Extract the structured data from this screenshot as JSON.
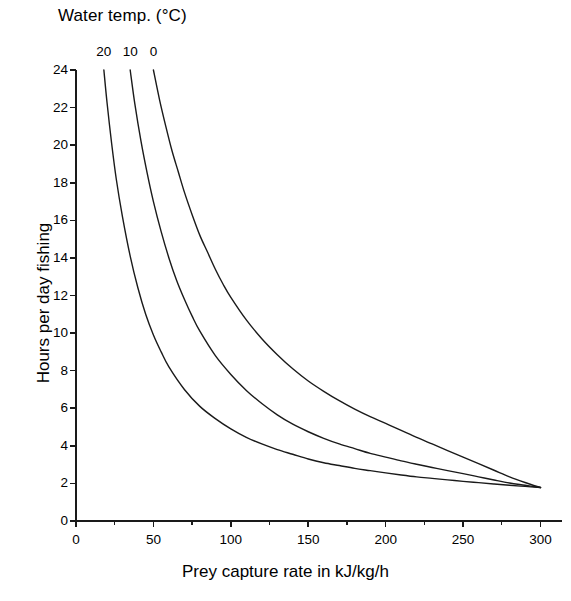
{
  "chart_data": {
    "type": "line",
    "title": "",
    "legend_title": "Water temp. (°C)",
    "legend_position": "top-inside-curve-labels",
    "grid": false,
    "xlabel": "Prey capture rate in kJ/kg/h",
    "ylabel": "Hours per day fishing",
    "xlim": [
      0,
      310
    ],
    "ylim": [
      0,
      24
    ],
    "xticks": [
      0,
      50,
      100,
      150,
      200,
      250,
      300
    ],
    "xtick_labels": [
      "0",
      "50",
      "100",
      "150",
      "200",
      "250",
      "300"
    ],
    "xminor_ticks": [
      25,
      75,
      125,
      175,
      225,
      275
    ],
    "yticks": [
      0,
      2,
      4,
      6,
      8,
      10,
      12,
      14,
      16,
      18,
      20,
      22,
      24
    ],
    "ytick_labels": [
      "0",
      "2",
      "4",
      "6",
      "8",
      "10",
      "12",
      "14",
      "16",
      "18",
      "20",
      "22",
      "24"
    ],
    "line_color": "#1a1a1a",
    "line_width": 1.4,
    "axis_color": "#1a1a1a",
    "background": "#ffffff",
    "series": [
      {
        "name": "20",
        "label": "20",
        "label_x": 18,
        "label_y": 24,
        "x": [
          18,
          20,
          23,
          26,
          30,
          35,
          40,
          45,
          50,
          55,
          60,
          70,
          80,
          90,
          100,
          110,
          120,
          130,
          140,
          150,
          160,
          170,
          180,
          190,
          200,
          210,
          220,
          230,
          240,
          250,
          260,
          270,
          280,
          290,
          300
        ],
        "y": [
          24.0,
          22.3,
          20.1,
          18.2,
          16.2,
          14.1,
          12.4,
          11.0,
          9.9,
          9.0,
          8.2,
          7.0,
          6.1,
          5.45,
          4.9,
          4.45,
          4.1,
          3.8,
          3.55,
          3.3,
          3.1,
          2.95,
          2.8,
          2.68,
          2.56,
          2.45,
          2.35,
          2.27,
          2.19,
          2.11,
          2.04,
          1.97,
          1.9,
          1.84,
          1.78
        ]
      },
      {
        "name": "10",
        "label": "10",
        "label_x": 35,
        "label_y": 24,
        "x": [
          35,
          38,
          42,
          46,
          50,
          55,
          60,
          65,
          70,
          75,
          80,
          90,
          100,
          110,
          120,
          130,
          140,
          150,
          160,
          170,
          180,
          190,
          200,
          210,
          220,
          230,
          240,
          250,
          260,
          270,
          280,
          290,
          300
        ],
        "y": [
          24.0,
          22.2,
          20.2,
          18.5,
          17.0,
          15.4,
          14.0,
          12.8,
          11.8,
          10.9,
          10.1,
          8.8,
          7.8,
          6.95,
          6.25,
          5.65,
          5.15,
          4.75,
          4.4,
          4.1,
          3.85,
          3.6,
          3.4,
          3.2,
          3.02,
          2.85,
          2.68,
          2.52,
          2.35,
          2.18,
          2.02,
          1.9,
          1.78
        ]
      },
      {
        "name": "0",
        "label": "0",
        "label_x": 50,
        "label_y": 24,
        "x": [
          50,
          54,
          58,
          62,
          66,
          70,
          75,
          80,
          85,
          90,
          95,
          100,
          110,
          120,
          130,
          140,
          150,
          160,
          170,
          180,
          190,
          200,
          210,
          220,
          230,
          240,
          250,
          260,
          270,
          280,
          290,
          300
        ],
        "y": [
          24.0,
          22.4,
          21.0,
          19.7,
          18.6,
          17.5,
          16.3,
          15.2,
          14.3,
          13.4,
          12.6,
          11.9,
          10.7,
          9.7,
          8.85,
          8.1,
          7.45,
          6.9,
          6.4,
          5.95,
          5.55,
          5.2,
          4.82,
          4.45,
          4.1,
          3.75,
          3.4,
          3.05,
          2.7,
          2.35,
          2.05,
          1.78
        ]
      }
    ]
  },
  "axes": {
    "x_title": "Prey capture rate in kJ/kg/h",
    "y_title": "Hours per day fishing"
  },
  "legend": {
    "title": "Water temp. (°C)"
  }
}
